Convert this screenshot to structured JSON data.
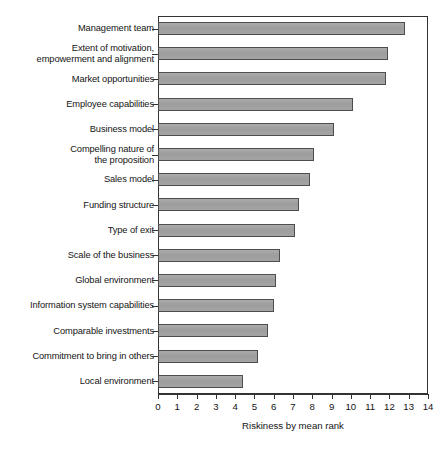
{
  "chart_data": {
    "type": "bar",
    "orientation": "horizontal",
    "title": "",
    "xlabel": "Riskiness by mean rank",
    "ylabel": "",
    "xlim": [
      0,
      14
    ],
    "xticks": [
      0,
      1,
      2,
      3,
      4,
      5,
      6,
      7,
      8,
      9,
      10,
      11,
      12,
      13,
      14
    ],
    "grid": false,
    "legend": false,
    "bar_fill_color": "#a0a0a0",
    "bar_edge_color": "#4d4d4d",
    "axis_color": "#333333",
    "categories": [
      "Management team",
      "Extent of motivation,\nempowerment and alignment",
      "Market opportunities",
      "Employee capabilities",
      "Business model",
      "Compelling nature of\nthe proposition",
      "Sales model",
      "Funding structure",
      "Type of exit",
      "Scale of the business",
      "Global environment",
      "Information system capabilities",
      "Comparable investments",
      "Commitment to bring in others",
      "Local environment"
    ],
    "values": [
      12.8,
      11.9,
      11.8,
      10.1,
      9.1,
      8.1,
      7.9,
      7.3,
      7.1,
      6.3,
      6.1,
      6.0,
      5.7,
      5.2,
      4.4
    ]
  },
  "caption": {
    "text": ""
  }
}
